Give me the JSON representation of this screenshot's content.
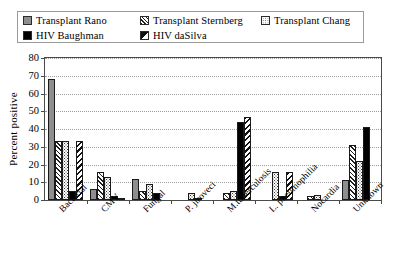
{
  "chart_data": {
    "type": "bar",
    "title": "",
    "xlabel": "",
    "ylabel": "Percent positive",
    "ylim": [
      0,
      80
    ],
    "ytick_step": 10,
    "yticks": [
      0,
      10,
      20,
      30,
      40,
      50,
      60,
      70,
      80
    ],
    "ytick_labels": [
      "0",
      "10",
      "20",
      "30",
      "40",
      "50",
      "60",
      "70",
      "80"
    ],
    "grid": true,
    "grid_axis": "y",
    "legend_position": "top",
    "categories": [
      "Bacterial",
      "CMV",
      "Fungal",
      "P. jiroveci",
      "M.tuberculosis",
      "L. pneumophilia",
      "Nocardia",
      "Unknown"
    ],
    "series": [
      {
        "name": "Transplant Rano",
        "fill": "solid-gray",
        "color": "#8e8e8e",
        "values": [
          68,
          6,
          12,
          0,
          0,
          0,
          0,
          11
        ]
      },
      {
        "name": "Transplant Sternberg",
        "fill": "diagonal-hatch-forward",
        "color": "#1d1d1d",
        "values": [
          33,
          16,
          5,
          0,
          4,
          0,
          2,
          31
        ]
      },
      {
        "name": "Transplant Chang",
        "fill": "dotted",
        "color": "#3a3a3a",
        "values": [
          33,
          13,
          9,
          4,
          5,
          16,
          3,
          22
        ]
      },
      {
        "name": "HIV Baughman",
        "fill": "solid-black",
        "color": "#000000",
        "values": [
          5,
          2,
          4,
          1,
          44,
          2,
          0,
          41
        ]
      },
      {
        "name": "HIV daSilva",
        "fill": "diagonal-hatch-back",
        "color": "#111111",
        "values": [
          33,
          1,
          0,
          0,
          47,
          16,
          0,
          0
        ]
      }
    ]
  },
  "legend": {
    "items": [
      {
        "label": "Transplant Rano",
        "swatch": "fill-rano"
      },
      {
        "label": "Transplant Sternberg",
        "swatch": "fill-sternberg"
      },
      {
        "label": "Transplant Chang",
        "swatch": "fill-chang"
      },
      {
        "label": "HIV Baughman",
        "swatch": "fill-baughman"
      },
      {
        "label": "HIV daSilva",
        "swatch": "fill-dasilva"
      }
    ]
  }
}
